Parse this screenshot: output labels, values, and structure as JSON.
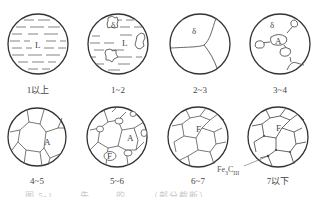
{
  "figure": {
    "panels": [
      {
        "id": "p1",
        "label": "1以上",
        "phases": [
          "L"
        ]
      },
      {
        "id": "p2",
        "label": "1~2",
        "phases": [
          "δ",
          "L"
        ]
      },
      {
        "id": "p3",
        "label": "2~3",
        "phases": [
          "δ"
        ]
      },
      {
        "id": "p4",
        "label": "3~4",
        "phases": [
          "δ",
          "A"
        ]
      },
      {
        "id": "p5",
        "label": "4~5",
        "phases": [
          "A"
        ]
      },
      {
        "id": "p6",
        "label": "5~6",
        "phases": [
          "A",
          "F"
        ]
      },
      {
        "id": "p7",
        "label": "6~7",
        "phases": [
          "F"
        ]
      },
      {
        "id": "p8",
        "label": "7以下",
        "phases": [
          "F"
        ]
      }
    ],
    "annotation": {
      "base": "Fe",
      "sub1": "3",
      "mid": "C",
      "sub2": "III"
    },
    "caption": "图 5-1 …… 先 …… 的 ……（部分截断）"
  }
}
